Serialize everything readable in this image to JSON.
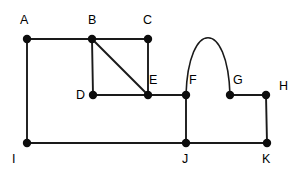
{
  "diagram": {
    "type": "node-link-graph",
    "canvas": {
      "width": 300,
      "height": 173,
      "background": "#ffffff"
    },
    "style": {
      "edge_color": "#1a1a1a",
      "node_color": "#0d0d0d",
      "label_color": "#000000",
      "node_radius": 4.2,
      "edge_width": 1.9
    },
    "vertices": [
      {
        "id": "A",
        "label": "A",
        "x": 27,
        "y": 39,
        "label_x": 20,
        "label_y": 24
      },
      {
        "id": "B",
        "label": "B",
        "x": 92,
        "y": 39,
        "label_x": 88,
        "label_y": 24
      },
      {
        "id": "C",
        "label": "C",
        "x": 148,
        "y": 39,
        "label_x": 143,
        "label_y": 24
      },
      {
        "id": "D",
        "label": "D",
        "x": 93,
        "y": 95,
        "label_x": 76,
        "label_y": 99
      },
      {
        "id": "E",
        "label": "E",
        "x": 148,
        "y": 95,
        "label_x": 149,
        "label_y": 84
      },
      {
        "id": "F",
        "label": "F",
        "x": 186,
        "y": 95,
        "label_x": 189,
        "label_y": 84
      },
      {
        "id": "G",
        "label": "G",
        "x": 230,
        "y": 95,
        "label_x": 233,
        "label_y": 84
      },
      {
        "id": "H",
        "label": "H",
        "x": 266,
        "y": 95,
        "label_x": 279,
        "label_y": 90
      },
      {
        "id": "I",
        "label": "I",
        "x": 27,
        "y": 143,
        "label_x": 12,
        "label_y": 163
      },
      {
        "id": "J",
        "label": "J",
        "x": 186,
        "y": 143,
        "label_x": 182,
        "label_y": 163
      },
      {
        "id": "K",
        "label": "K",
        "x": 267,
        "y": 143,
        "label_x": 262,
        "label_y": 163
      }
    ],
    "edges": [
      {
        "from": "A",
        "to": "B",
        "shape": "straight"
      },
      {
        "from": "B",
        "to": "C",
        "shape": "straight"
      },
      {
        "from": "A",
        "to": "I",
        "shape": "straight"
      },
      {
        "from": "B",
        "to": "D",
        "shape": "straight"
      },
      {
        "from": "B",
        "to": "E",
        "shape": "straight"
      },
      {
        "from": "C",
        "to": "E",
        "shape": "straight"
      },
      {
        "from": "D",
        "to": "E",
        "shape": "straight"
      },
      {
        "from": "E",
        "to": "F",
        "shape": "straight"
      },
      {
        "from": "F",
        "to": "G",
        "shape": "arc",
        "apex_y": 38
      },
      {
        "from": "G",
        "to": "H",
        "shape": "straight"
      },
      {
        "from": "F",
        "to": "J",
        "shape": "straight"
      },
      {
        "from": "H",
        "to": "K",
        "shape": "straight"
      },
      {
        "from": "I",
        "to": "J",
        "shape": "straight"
      },
      {
        "from": "J",
        "to": "K",
        "shape": "straight"
      }
    ]
  }
}
